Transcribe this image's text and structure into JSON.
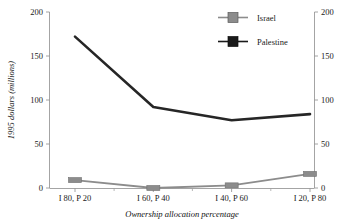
{
  "chart_data": {
    "type": "line",
    "title": "",
    "xlabel": "Ownership allocation percentage",
    "ylabel": "1995 dollars (millions)",
    "categories": [
      "I 80, P 20",
      "I 60, P 40",
      "I 40, P 60",
      "I 20, P 80"
    ],
    "ylim": [
      0,
      200
    ],
    "yticks": [
      0,
      50,
      100,
      150,
      200
    ],
    "ytick_labels": [
      "0",
      "50",
      "100",
      "150",
      "200"
    ],
    "right_axis": {
      "ylim": [
        0,
        200
      ],
      "yticks": [
        0,
        50,
        100,
        150,
        200
      ],
      "ytick_labels": [
        "0",
        "50",
        "100",
        "150",
        "200"
      ]
    },
    "grid": false,
    "legend_position": "top-right",
    "series": [
      {
        "name": "Israel",
        "color": "#8c8c8c",
        "marker": "square",
        "marker_color": "#8c8c8c",
        "values": [
          9,
          0,
          3,
          16
        ]
      },
      {
        "name": "Palestine",
        "color": "#262626",
        "marker": "square",
        "marker_color": "#1a1a1a",
        "values": [
          172,
          92,
          77,
          84
        ]
      }
    ]
  },
  "axes": {
    "y_left_label": "1995 dollars (millions)",
    "y_left_ticks": [
      "200",
      "150",
      "100",
      "50",
      "0"
    ],
    "y_right_ticks": [
      "200",
      "150",
      "100",
      "50",
      "0"
    ],
    "x_label": "Ownership allocation percentage",
    "x_ticks": [
      "I 80, P 20",
      "I 60, P 40",
      "I 40, P 60",
      "I 20, P 80"
    ]
  },
  "legend": {
    "items": [
      {
        "label": "Israel",
        "color": "#8c8c8c"
      },
      {
        "label": "Palestine",
        "color": "#1a1a1a"
      }
    ]
  }
}
